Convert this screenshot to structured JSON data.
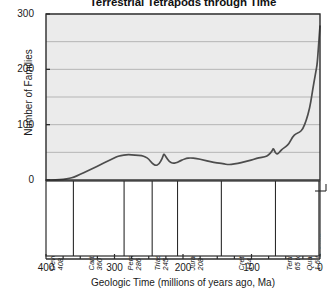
{
  "chart_data": {
    "type": "line",
    "title": "Terrestrial Tetrapods through Time",
    "xlabel": "Geologic Time (millions of years ago, Ma)",
    "ylabel": "Number of Families",
    "xlim": [
      400,
      0
    ],
    "ylim": [
      0,
      300
    ],
    "x_ticks": [
      400,
      300,
      200,
      100,
      0
    ],
    "x_minor_tick_interval": 25,
    "y_ticks": [
      0,
      100,
      200,
      300
    ],
    "gridlines": [
      0,
      50,
      100,
      150,
      200,
      250,
      300
    ],
    "grid": true,
    "legend": "none",
    "x_axis_reversed": true,
    "series": [
      {
        "name": "Terrestrial tetrapod families",
        "x": [
          400,
          385,
          375,
          365,
          360,
          350,
          340,
          330,
          320,
          310,
          300,
          295,
          286,
          280,
          270,
          260,
          255,
          250,
          245,
          240,
          235,
          230,
          228,
          225,
          220,
          215,
          210,
          208,
          205,
          200,
          195,
          190,
          180,
          170,
          160,
          150,
          144,
          140,
          135,
          130,
          120,
          110,
          100,
          95,
          90,
          80,
          75,
          70,
          68,
          65,
          62,
          60,
          58,
          55,
          50,
          45,
          40,
          35,
          30,
          25,
          20,
          15,
          12,
          10,
          8,
          6,
          4,
          2,
          0
        ],
        "y": [
          0,
          0,
          1,
          3,
          5,
          10,
          16,
          22,
          28,
          34,
          40,
          43,
          45,
          46,
          45,
          44,
          42,
          38,
          30,
          26,
          28,
          40,
          48,
          42,
          33,
          30,
          31,
          32,
          34,
          37,
          39,
          40,
          39,
          36,
          33,
          31,
          30,
          29,
          28,
          28,
          30,
          33,
          36,
          38,
          40,
          42,
          45,
          52,
          58,
          48,
          47,
          49,
          52,
          56,
          60,
          66,
          78,
          84,
          86,
          92,
          108,
          130,
          152,
          168,
          182,
          196,
          210,
          245,
          278
        ]
      }
    ],
    "periods": [
      {
        "name": "Devonian",
        "range": "408 to 360 Ma",
        "start": 408,
        "end": 360
      },
      {
        "name": "Carboniferous",
        "range": "360 to 286 Ma",
        "start": 360,
        "end": 286
      },
      {
        "name": "Permian",
        "range": "286 to 245 Ma",
        "start": 286,
        "end": 245
      },
      {
        "name": "Triassic",
        "range": "245 to 208 Ma",
        "start": 245,
        "end": 208
      },
      {
        "name": "Jurassic",
        "range": "208 to 144 Ma",
        "start": 208,
        "end": 144
      },
      {
        "name": "Cretaceous",
        "range": "144 to 65 Ma",
        "start": 144,
        "end": 65
      },
      {
        "name": "Tertiary",
        "range": "65 to 1.6 Ma",
        "start": 65,
        "end": 1.6
      },
      {
        "name": "Quaternary",
        "range": "1.6 to 0 Ma",
        "start": 1.6,
        "end": 0
      }
    ],
    "colors": {
      "plot_background": "#ebebeb",
      "line": "#4d4d4d",
      "grid": "#b5b5b5",
      "axis": "#2b2b2b",
      "text": "#1a1a1a"
    }
  }
}
